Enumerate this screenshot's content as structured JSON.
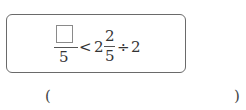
{
  "problem": {
    "fraction1": {
      "numerator_blank_icon": "empty-square",
      "denominator": "5"
    },
    "comparison": "<",
    "mixed_number": {
      "whole": "2",
      "numerator": "2",
      "denominator": "5"
    },
    "operator": "÷",
    "divisor": "2"
  },
  "answer": {
    "open_paren": "(",
    "close_paren": ")",
    "value": ""
  }
}
